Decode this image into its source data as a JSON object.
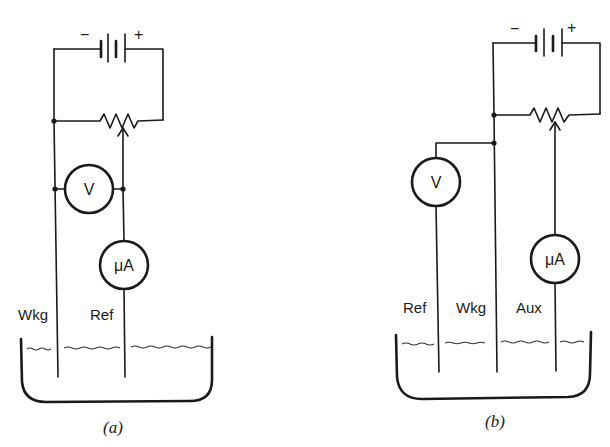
{
  "figure": {
    "panels": [
      {
        "id": "a",
        "caption": "(a)",
        "battery": {
          "minus": "−",
          "plus": "+"
        },
        "voltmeter": {
          "label": "V"
        },
        "ammeter": {
          "label": "μA"
        },
        "electrodes": [
          "Wkg",
          "Ref"
        ]
      },
      {
        "id": "b",
        "caption": "(b)",
        "battery": {
          "minus": "−",
          "plus": "+"
        },
        "voltmeter": {
          "label": "V"
        },
        "ammeter": {
          "label": "μA"
        },
        "electrodes": [
          "Ref",
          "Wkg",
          "Aux"
        ]
      }
    ]
  }
}
